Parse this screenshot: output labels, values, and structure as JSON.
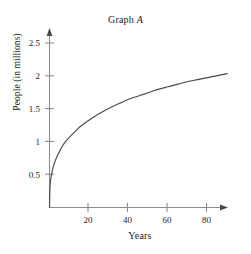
{
  "chart_data": {
    "type": "line",
    "title": "Graph A",
    "title_plain": "Graph ",
    "title_italic": "A",
    "xlabel": "Years",
    "ylabel": "People (in millions)",
    "xlim": [
      0,
      92
    ],
    "ylim": [
      0,
      2.72
    ],
    "grid": false,
    "legend": null,
    "xticks": [
      20,
      40,
      60,
      80
    ],
    "xtick_labels": [
      "20",
      "40",
      "60",
      "80"
    ],
    "yticks": [
      0.5,
      1,
      1.5,
      2,
      2.5
    ],
    "ytick_labels": [
      "0.5",
      "1",
      "1.5",
      "2",
      "2.5"
    ],
    "series": [
      {
        "name": "population",
        "x": [
          0,
          0.2,
          0.5,
          1,
          1.5,
          2,
          3,
          4,
          5,
          6,
          8,
          10,
          12,
          15,
          18,
          20,
          25,
          30,
          35,
          40,
          45,
          50,
          55,
          60,
          65,
          70,
          75,
          80,
          85,
          90
        ],
        "y": [
          0,
          0.29,
          0.4,
          0.5,
          0.57,
          0.63,
          0.72,
          0.79,
          0.85,
          0.91,
          1.0,
          1.07,
          1.13,
          1.22,
          1.29,
          1.33,
          1.43,
          1.51,
          1.58,
          1.65,
          1.7,
          1.75,
          1.8,
          1.84,
          1.88,
          1.92,
          1.95,
          1.98,
          2.01,
          2.04
        ]
      }
    ],
    "curve_color": "#4a4a4a",
    "axis_color": "#8c8c8c"
  },
  "axes": {
    "y_tick_0": "0.5",
    "y_tick_1": "1",
    "y_tick_2": "1.5",
    "y_tick_3": "2",
    "y_tick_4": "2.5",
    "x_tick_0": "20",
    "x_tick_1": "40",
    "x_tick_2": "60",
    "x_tick_3": "80"
  }
}
